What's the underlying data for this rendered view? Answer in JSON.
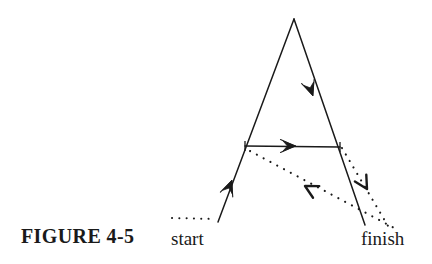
{
  "figure": {
    "caption": "FIGURE 4-5",
    "start_label": "start",
    "finish_label": "finish",
    "ink_color": "#1a1a1a",
    "background_color": "#ffffff",
    "width": 432,
    "height": 264
  },
  "diagram": {
    "type": "path-traversal-diagram",
    "points": {
      "apex": [
        294,
        19
      ],
      "left_base": [
        218,
        222
      ],
      "right_base": [
        365,
        225
      ],
      "crossbar_left": [
        245,
        146
      ],
      "crossbar_right": [
        340,
        147
      ],
      "start_dotted_left": [
        172,
        218
      ],
      "start_dotted_right": [
        214,
        219
      ],
      "return_dotted_end": [
        396,
        229
      ],
      "right_dotted_start": [
        342,
        148
      ],
      "right_dotted_end": [
        391,
        231
      ]
    },
    "segments": [
      {
        "name": "left-ascending-line",
        "style": "solid",
        "from": [
          218,
          222
        ],
        "to": [
          294,
          19
        ],
        "arrow": "up-right",
        "arrow_at": [
          232,
          180
        ],
        "arrow_style": "filled-barbed"
      },
      {
        "name": "right-descending-line",
        "style": "solid",
        "from": [
          294,
          19
        ],
        "to": [
          365,
          225
        ],
        "arrow": "down-right",
        "arrow_at": [
          313,
          96
        ],
        "arrow_style": "filled-barbed"
      },
      {
        "name": "horizontal-crossbar",
        "style": "solid",
        "from": [
          245,
          146
        ],
        "to": [
          340,
          147
        ],
        "arrow": "right",
        "arrow_at": [
          296,
          146
        ],
        "arrow_style": "filled-barbed"
      },
      {
        "name": "return-dotted-diagonal",
        "style": "dotted",
        "from": [
          250,
          151
        ],
        "to": [
          396,
          229
        ],
        "arrow": "left-up",
        "arrow_at": [
          305,
          186
        ],
        "arrow_style": "open-chevron"
      },
      {
        "name": "right-dotted-descending",
        "style": "dotted",
        "from": [
          342,
          148
        ],
        "to": [
          391,
          231
        ],
        "arrow": "down",
        "arrow_at": [
          367,
          189
        ],
        "arrow_style": "open-chevron"
      },
      {
        "name": "start-dotted-lead-in",
        "style": "dotted",
        "from": [
          172,
          218
        ],
        "to": [
          214,
          219
        ],
        "arrow": "none"
      }
    ]
  }
}
